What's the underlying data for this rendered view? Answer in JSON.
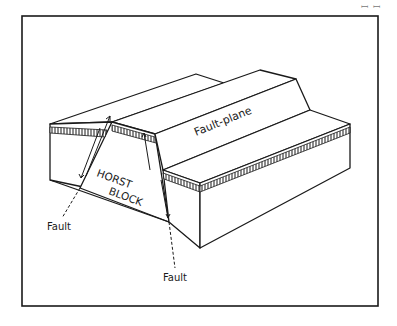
{
  "page_marker": "ꟷ ꟷ",
  "diagram": {
    "title": "Horst block",
    "labels": {
      "fault_plane": "Fault-plane",
      "horst_line1": "HORST",
      "horst_line2": "BLOCK",
      "fault_left": "Fault",
      "fault_right": "Fault"
    },
    "colors": {
      "ink": "#1a1a1a",
      "paper": "#ffffff"
    }
  }
}
